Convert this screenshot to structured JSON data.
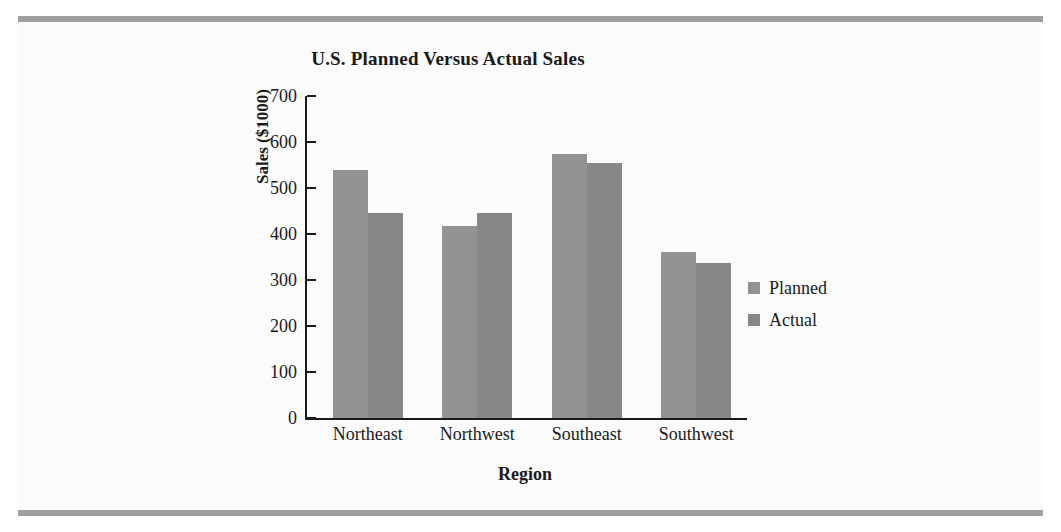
{
  "figure": {
    "background": "#fbfbfb",
    "rule_color": "#a0a0a0"
  },
  "chart_data": {
    "type": "bar",
    "title": "U.S. Planned Versus Actual Sales",
    "xlabel": "Region",
    "ylabel": "Sales ($1000)",
    "categories": [
      "Northeast",
      "Northwest",
      "Southeast",
      "Southwest"
    ],
    "series": [
      {
        "name": "Planned",
        "color": "#939393",
        "values": [
          540,
          418,
          573,
          360
        ]
      },
      {
        "name": "Actual",
        "color": "#878787",
        "values": [
          445,
          445,
          555,
          338
        ]
      }
    ],
    "ylim": [
      0,
      700
    ],
    "ytick_step": 100,
    "yticks": [
      700,
      600,
      500,
      400,
      300,
      200,
      100,
      0
    ],
    "ytick_labels": [
      "700",
      "600",
      "500",
      "400",
      "300",
      "200",
      "100",
      "0"
    ],
    "grid": false,
    "legend_position": "right"
  }
}
